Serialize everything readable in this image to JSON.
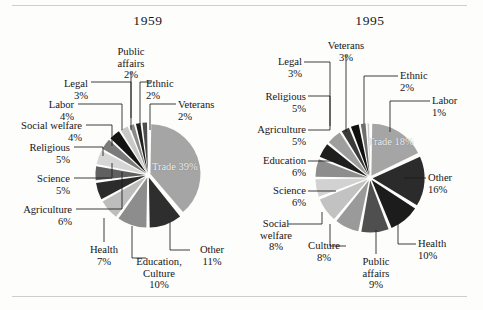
{
  "figure": {
    "background": "#fdfdfb",
    "rules": [
      "top-rule",
      "bottom-rule"
    ]
  },
  "chart_data": [
    {
      "type": "pie",
      "title": "1959",
      "unit": "%",
      "exploded": true,
      "start_angle_deg": -90,
      "direction": "clockwise",
      "center": {
        "x": 148,
        "y": 175
      },
      "radius": 50,
      "categories": [
        "Trade",
        "Other",
        "Education, Culture",
        "Health",
        "Agriculture",
        "Science",
        "Religious",
        "Social welfare",
        "Labor",
        "Legal",
        "Public affairs",
        "Ethnic",
        "Veterans"
      ],
      "values": [
        39,
        11,
        10,
        7,
        6,
        5,
        5,
        4,
        4,
        3,
        2,
        2,
        2
      ],
      "colors": [
        "#a5a5a5",
        "#2e2e2e",
        "#8d8d8d",
        "#bdbdbd",
        "#2b2b2b",
        "#606060",
        "#d6d6d6",
        "#7b7b7b",
        "#141414",
        "#c9c9c9",
        "#8a8a8a",
        "#1f1f1f",
        "#4d4d4d"
      ],
      "slice_labels": [
        {
          "name": "Trade",
          "pct": "39%",
          "placement": "inside"
        },
        {
          "name": "Other",
          "pct": "11%",
          "placement": "outside"
        },
        {
          "name": "Education,|Culture",
          "pct": "10%",
          "placement": "outside"
        },
        {
          "name": "Health",
          "pct": "7%",
          "placement": "outside"
        },
        {
          "name": "Agriculture",
          "pct": "6%",
          "placement": "outside"
        },
        {
          "name": "Science",
          "pct": "5%",
          "placement": "outside"
        },
        {
          "name": "Religious",
          "pct": "5%",
          "placement": "outside"
        },
        {
          "name": "Social welfare",
          "pct": "4%",
          "placement": "outside"
        },
        {
          "name": "Labor",
          "pct": "4%",
          "placement": "outside"
        },
        {
          "name": "Legal",
          "pct": "3%",
          "placement": "outside"
        },
        {
          "name": "Public|affairs",
          "pct": "2%",
          "placement": "outside"
        },
        {
          "name": "Ethnic",
          "pct": "2%",
          "placement": "outside"
        },
        {
          "name": "Veterans",
          "pct": "2%",
          "placement": "outside"
        }
      ]
    },
    {
      "type": "pie",
      "title": "1995",
      "unit": "%",
      "exploded": true,
      "start_angle_deg": -90,
      "direction": "clockwise",
      "center": {
        "x": 370,
        "y": 178
      },
      "radius": 52,
      "categories": [
        "Trade",
        "Other",
        "Health",
        "Public affairs",
        "Culture",
        "Social welfare",
        "Science",
        "Education",
        "Agriculture",
        "Religious",
        "Legal",
        "Veterans",
        "Ethnic",
        "Labor"
      ],
      "values": [
        18,
        16,
        10,
        9,
        8,
        8,
        6,
        6,
        5,
        5,
        3,
        3,
        2,
        1
      ],
      "colors": [
        "#a5a5a5",
        "#2b2b2b",
        "#1c1c1c",
        "#4f4f4f",
        "#9a9a9a",
        "#c2c2c2",
        "#d2d2d2",
        "#8d8d8d",
        "#1f1f1f",
        "#9e9e9e",
        "#3a3a3a",
        "#101010",
        "#6e6e6e",
        "#c9c9c9"
      ],
      "slice_labels": [
        {
          "name": "Trade",
          "pct": "18%",
          "placement": "inside"
        },
        {
          "name": "Other",
          "pct": "16%",
          "placement": "outside"
        },
        {
          "name": "Health",
          "pct": "10%",
          "placement": "outside"
        },
        {
          "name": "Public|affairs",
          "pct": "9%",
          "placement": "outside"
        },
        {
          "name": "Culture",
          "pct": "8%",
          "placement": "outside"
        },
        {
          "name": "Social|welfare",
          "pct": "8%",
          "placement": "outside"
        },
        {
          "name": "Science",
          "pct": "6%",
          "placement": "outside"
        },
        {
          "name": "Education",
          "pct": "6%",
          "placement": "outside"
        },
        {
          "name": "Agriculture",
          "pct": "5%",
          "placement": "outside"
        },
        {
          "name": "Religious",
          "pct": "5%",
          "placement": "outside"
        },
        {
          "name": "Legal",
          "pct": "3%",
          "placement": "outside"
        },
        {
          "name": "Veterans",
          "pct": "3%",
          "placement": "outside"
        },
        {
          "name": "Ethnic",
          "pct": "2%",
          "placement": "outside"
        },
        {
          "name": "Labor",
          "pct": "1%",
          "placement": "outside"
        }
      ]
    }
  ],
  "left": {
    "title": "1959",
    "labels": {
      "public_affairs": {
        "name1": "Public",
        "name2": "affairs",
        "pct": "2%"
      },
      "legal": {
        "name1": "Legal",
        "pct": "3%"
      },
      "ethnic": {
        "name1": "Ethnic",
        "pct": "2%"
      },
      "veterans": {
        "name1": "Veterans",
        "pct": "2%"
      },
      "labor": {
        "name1": "Labor",
        "pct": "4%"
      },
      "social_welfare": {
        "name1": "Social welfare",
        "pct": "4%"
      },
      "religious": {
        "name1": "Religious",
        "pct": "5%"
      },
      "science": {
        "name1": "Science",
        "pct": "5%"
      },
      "agriculture": {
        "name1": "Agriculture",
        "pct": "6%"
      },
      "health": {
        "name1": "Health",
        "pct": "7%"
      },
      "education_culture": {
        "name1": "Education,",
        "name2": "Culture",
        "pct": "10%"
      },
      "other": {
        "name1": "Other",
        "pct": "11%"
      },
      "trade": {
        "name1": "Trade",
        "pct": "39%"
      }
    }
  },
  "right": {
    "title": "1995",
    "labels": {
      "veterans": {
        "name1": "Veterans",
        "pct": "3%"
      },
      "legal": {
        "name1": "Legal",
        "pct": "3%"
      },
      "ethnic": {
        "name1": "Ethnic",
        "pct": "2%"
      },
      "labor": {
        "name1": "Labor",
        "pct": "1%"
      },
      "religious": {
        "name1": "Religious",
        "pct": "5%"
      },
      "agriculture": {
        "name1": "Agriculture",
        "pct": "5%"
      },
      "education": {
        "name1": "Education",
        "pct": "6%"
      },
      "science": {
        "name1": "Science",
        "pct": "6%"
      },
      "social_welfare": {
        "name1": "Social",
        "name2": "welfare",
        "pct": "8%"
      },
      "culture": {
        "name1": "Culture",
        "pct": "8%"
      },
      "public_affairs": {
        "name1": "Public",
        "name2": "affairs",
        "pct": "9%"
      },
      "health": {
        "name1": "Health",
        "pct": "10%"
      },
      "other": {
        "name1": "Other",
        "pct": "16%"
      },
      "trade": {
        "name1": "Trade",
        "pct": "18%"
      }
    }
  }
}
